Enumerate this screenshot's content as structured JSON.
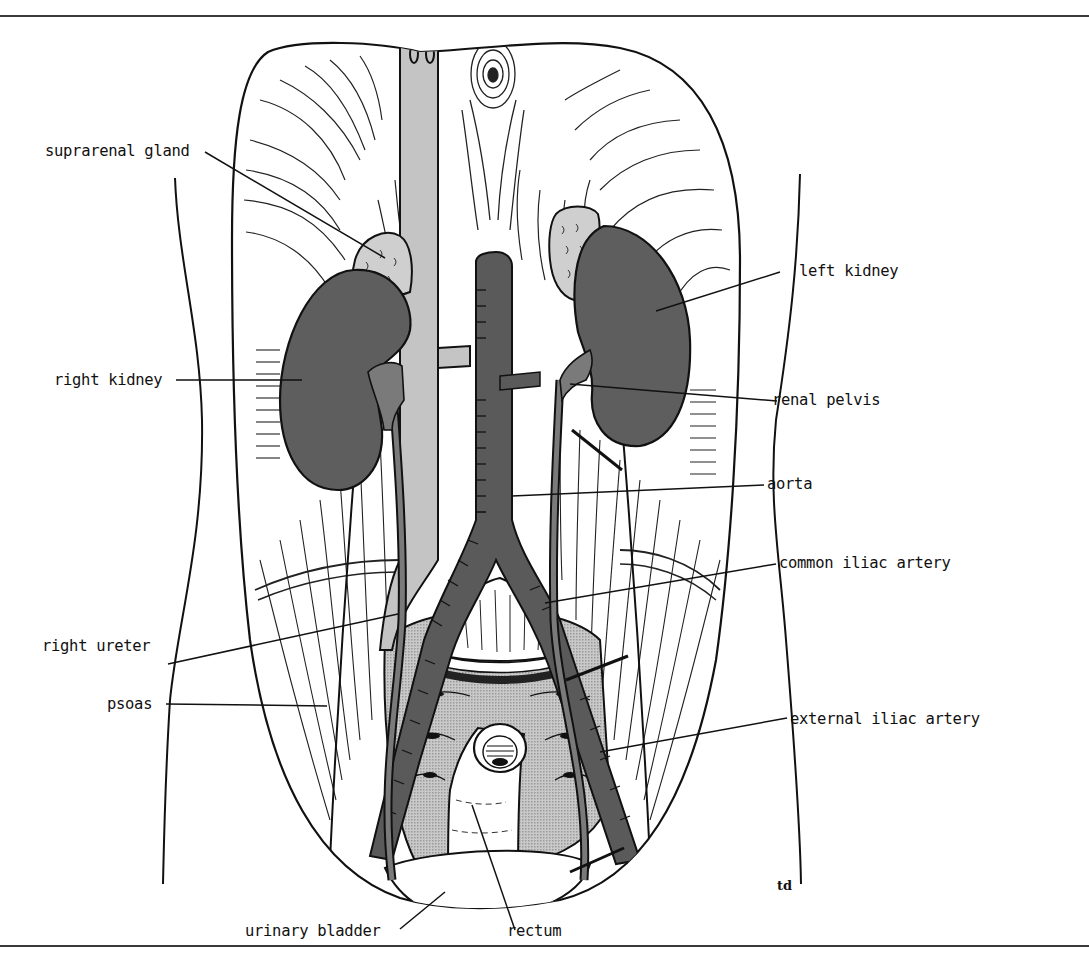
{
  "figure": {
    "signature": "td",
    "colors": {
      "outline": "#111111",
      "kidney": "#5e5e5e",
      "aorta": "#5a5a5a",
      "vena_cava": "#c4c4c4",
      "suprarenal": "#cfcfcf",
      "pelvic_stipple": "#bdbdbd",
      "background": "#ffffff"
    }
  },
  "labels": {
    "suprarenal_gland": "suprarenal gland",
    "right_kidney": "right kidney",
    "right_ureter": "right ureter",
    "psoas": "psoas",
    "urinary_bladder": "urinary bladder",
    "rectum": "rectum",
    "left_kidney": "left kidney",
    "renal_pelvis": "renal pelvis",
    "aorta": "aorta",
    "common_iliac_artery": "common iliac artery",
    "external_iliac_artery": "external iliac artery"
  }
}
